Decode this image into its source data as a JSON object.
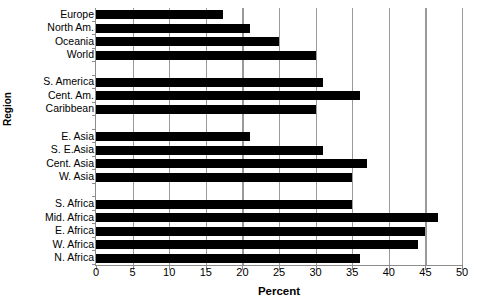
{
  "chart_data": {
    "type": "bar",
    "orientation": "horizontal",
    "title": "",
    "xlabel": "Percent",
    "ylabel": "Region",
    "xlim": [
      0,
      50
    ],
    "xticks": [
      0,
      5,
      10,
      15,
      20,
      25,
      30,
      35,
      40,
      45,
      50
    ],
    "grid": true,
    "legend": "none",
    "bar_color": "#000000",
    "categories": [
      "Europe",
      "North  Am.",
      "Oceania",
      "World",
      "",
      "S. America",
      "Cent. Am.",
      "Caribbean",
      "",
      "E. Asia",
      "S. E.Asia",
      "Cent. Asia",
      "W. Asia",
      "",
      "S. Africa",
      "Mid. Africa",
      "E. Africa",
      "W. Africa",
      "N. Africa"
    ],
    "values": [
      17.3,
      21.0,
      25.0,
      30.0,
      null,
      31.0,
      36.0,
      30.0,
      null,
      21.0,
      31.0,
      37.0,
      35.0,
      null,
      35.0,
      46.7,
      45.0,
      44.0,
      36.0
    ]
  }
}
